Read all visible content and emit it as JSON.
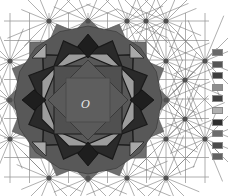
{
  "diagram": {
    "center_label": "O",
    "grid": {
      "spacing": 19.5,
      "x_start": 10,
      "y_start": 21,
      "cols": 11,
      "rows": 9,
      "line_color": "#9a9a9a"
    },
    "tiling": {
      "type": "octagonal star tiling",
      "center": [
        88,
        100
      ],
      "outer_color": "#6e6e6e",
      "mid_color": "#585858",
      "inner_color": "#4a4a4a",
      "light_color": "#9c9c9c",
      "dark_color": "#2a2a2a",
      "edge_color": "#1a1a1a"
    },
    "nodes": [
      [
        49,
        21
      ],
      [
        88,
        21
      ],
      [
        127,
        21
      ],
      [
        146,
        21
      ],
      [
        166,
        21
      ],
      [
        10,
        61
      ],
      [
        166,
        61
      ],
      [
        205,
        61
      ],
      [
        10,
        100
      ],
      [
        166,
        100
      ],
      [
        185,
        80
      ],
      [
        10,
        139
      ],
      [
        166,
        139
      ],
      [
        205,
        139
      ],
      [
        185,
        119
      ],
      [
        49,
        178
      ],
      [
        88,
        178
      ],
      [
        127,
        178
      ],
      [
        166,
        178
      ]
    ],
    "legend": {
      "swatches": [
        {
          "color": "#6a6a6a"
        },
        {
          "color": "#555555"
        },
        {
          "color": "#3e3e3e"
        },
        {
          "color": "#8e8e8e"
        },
        {
          "color": "#404040"
        },
        {
          "color": "#b0b0b0"
        },
        {
          "color": "#2e2e2e"
        },
        {
          "color": "#6c6c6c"
        },
        {
          "color": "#4c4c4c"
        },
        {
          "color": "#626262"
        }
      ]
    }
  }
}
